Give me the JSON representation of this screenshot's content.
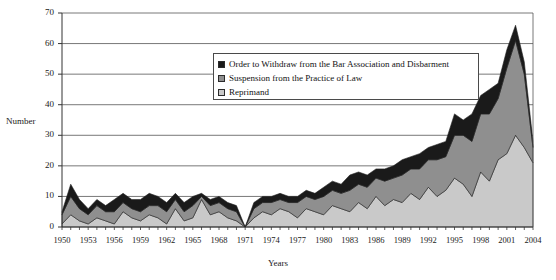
{
  "chart_data": {
    "type": "area",
    "stacked": true,
    "title": "",
    "xlabel": "Years",
    "ylabel": "Number",
    "ylim": [
      0,
      70
    ],
    "ytick_step": 10,
    "yticks": [
      0,
      10,
      20,
      30,
      40,
      50,
      60,
      70
    ],
    "xlim": [
      1950,
      2004
    ],
    "xtick_step": 3,
    "xticks": [
      1950,
      1953,
      1956,
      1959,
      1962,
      1965,
      1968,
      1971,
      1974,
      1977,
      1980,
      1983,
      1986,
      1989,
      1992,
      1995,
      1998,
      2001,
      2004
    ],
    "grid": "horizontal",
    "legend_position": "upper-center",
    "x": [
      1950,
      1951,
      1952,
      1953,
      1954,
      1955,
      1956,
      1957,
      1958,
      1959,
      1960,
      1961,
      1962,
      1963,
      1964,
      1965,
      1966,
      1967,
      1968,
      1969,
      1970,
      1971,
      1972,
      1973,
      1974,
      1975,
      1976,
      1977,
      1978,
      1979,
      1980,
      1981,
      1982,
      1983,
      1984,
      1985,
      1986,
      1987,
      1988,
      1989,
      1990,
      1991,
      1992,
      1993,
      1994,
      1995,
      1996,
      1997,
      1998,
      1999,
      2000,
      2001,
      2002,
      2003,
      2004
    ],
    "series": [
      {
        "name": "Reprimand",
        "color": "#c9c9c9",
        "values": [
          1,
          4,
          2,
          1,
          3,
          2,
          1,
          5,
          3,
          2,
          4,
          3,
          1,
          6,
          2,
          3,
          9,
          4,
          5,
          3,
          2,
          0,
          3,
          5,
          4,
          6,
          5,
          3,
          6,
          5,
          4,
          7,
          6,
          5,
          8,
          6,
          10,
          7,
          9,
          8,
          11,
          9,
          13,
          10,
          12,
          16,
          14,
          10,
          18,
          15,
          22,
          24,
          30,
          26,
          21
        ]
      },
      {
        "name": "Suspension from the Practice of Law",
        "color": "#8f8f8f",
        "values": [
          3,
          6,
          4,
          3,
          4,
          3,
          4,
          3,
          3,
          3,
          3,
          4,
          4,
          3,
          3,
          4,
          1,
          3,
          3,
          3,
          3,
          0,
          3,
          3,
          4,
          3,
          3,
          5,
          4,
          4,
          6,
          5,
          5,
          7,
          6,
          7,
          6,
          8,
          7,
          9,
          8,
          10,
          9,
          12,
          11,
          14,
          16,
          18,
          19,
          22,
          20,
          28,
          31,
          24,
          5
        ]
      },
      {
        "name": "Order to Withdraw from the Bar Association and Disbarment",
        "color": "#1a1a1a",
        "values": [
          1,
          4,
          3,
          2,
          2,
          2,
          4,
          3,
          3,
          4,
          4,
          3,
          3,
          2,
          3,
          3,
          1,
          2,
          2,
          2,
          2,
          0,
          2,
          2,
          2,
          2,
          2,
          2,
          2,
          2,
          3,
          3,
          3,
          5,
          4,
          4,
          3,
          4,
          4,
          5,
          4,
          5,
          4,
          5,
          5,
          7,
          5,
          9,
          6,
          8,
          5,
          6,
          5,
          4,
          2
        ]
      }
    ]
  },
  "axes": {
    "ylabel_text": "Number",
    "xlabel_text": "Years"
  },
  "legend": {
    "items": [
      {
        "label": "Order to Withdraw from the Bar Association and Disbarment",
        "color": "#1a1a1a"
      },
      {
        "label": "Suspension from the Practice of Law",
        "color": "#8f8f8f"
      },
      {
        "label": "Reprimand",
        "color": "#c9c9c9"
      }
    ]
  }
}
